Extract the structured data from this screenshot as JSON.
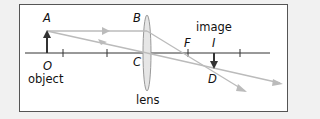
{
  "diagram": {
    "labels": {
      "A": "A",
      "B": "B",
      "C": "C",
      "O": "O",
      "F": "F",
      "I": "I",
      "D": "D",
      "object": "object",
      "image": "image",
      "lens": "lens"
    },
    "colors": {
      "background": "#f1f1f1",
      "frame_border": "#555555",
      "axis": "#333333",
      "ray": "#bbbbbb",
      "arrow": "#333333",
      "lens_fill": "#e6e6e6",
      "lens_stroke": "#999999"
    }
  }
}
